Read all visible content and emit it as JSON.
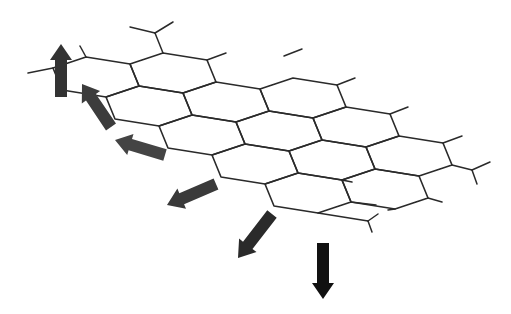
{
  "diagram": {
    "title": "",
    "colors": {
      "background": "#ffffff",
      "bond": "#2a2a2a",
      "arrow_dark": "#111111",
      "arrow_mid": "#3c3c3c",
      "arrow_light": "#4a4a4a"
    },
    "lattice": {
      "origin": [
        163,
        53
      ],
      "edge_vectors": {
        "A": [
          44,
          7
        ],
        "B": [
          9,
          22
        ],
        "C": [
          -33,
          11
        ]
      },
      "translation_i": [
        53,
        29
      ],
      "translation_j": [
        77,
        -4
      ],
      "hexagons": [
        {
          "i": 0,
          "j": -1
        },
        {
          "i": 1,
          "j": -1
        },
        {
          "i": 2,
          "j": -1
        },
        {
          "i": 3,
          "j": -1
        },
        {
          "i": 4,
          "j": -1
        },
        {
          "i": 0,
          "j": 0
        },
        {
          "i": 1,
          "j": 0
        },
        {
          "i": 2,
          "j": 0
        },
        {
          "i": 3,
          "j": 0
        },
        {
          "i": 4,
          "j": 0
        },
        {
          "i": 1,
          "j": 1
        },
        {
          "i": 2,
          "j": 1
        },
        {
          "i": 3,
          "j": 1
        }
      ],
      "dangling_bonds": [
        {
          "from": [
            163,
            53
          ],
          "to": [
            155,
            33
          ],
          "branches": [
            [
              130,
              27
            ],
            [
              173,
              22
            ]
          ]
        },
        {
          "from": [
            207,
            60
          ],
          "to": [
            226,
            53
          ]
        },
        {
          "from": [
            86,
            57
          ],
          "to": [
            80,
            46
          ]
        },
        {
          "from": [
            53,
            68
          ],
          "to": [
            28,
            73
          ]
        },
        {
          "from": [
            284,
            56
          ],
          "to": [
            302,
            49
          ]
        },
        {
          "from": [
            337,
            85
          ],
          "to": [
            355,
            78
          ]
        },
        {
          "from": [
            390,
            114
          ],
          "to": [
            408,
            107
          ]
        },
        {
          "from": [
            443,
            143
          ],
          "to": [
            462,
            136
          ]
        },
        {
          "from": [
            452,
            165
          ],
          "to": [
            472,
            170
          ],
          "branches": [
            [
              490,
              162
            ],
            [
              477,
              184
            ]
          ]
        },
        {
          "from": [
            428,
            198
          ],
          "to": [
            442,
            202
          ]
        },
        {
          "from": [
            395,
            209
          ],
          "to": [
            388,
            210
          ]
        },
        {
          "from": [
            351,
            202
          ],
          "to": [
            376,
            205
          ]
        },
        {
          "from": [
            342,
            180
          ],
          "to": [
            352,
            182
          ]
        },
        {
          "from": [
            318,
            213
          ],
          "to": [
            368,
            221
          ],
          "branches": [
            [
              378,
              214
            ],
            [
              372,
              232
            ]
          ]
        }
      ]
    },
    "arrows": [
      {
        "name": "arrow-up",
        "tail": [
          61,
          97
        ],
        "head": [
          61,
          44
        ],
        "color": "#333333"
      },
      {
        "name": "arrow-up-left",
        "tail": [
          111,
          127
        ],
        "head": [
          82,
          84
        ],
        "color": "#3c3c3c"
      },
      {
        "name": "arrow-left-up",
        "tail": [
          165,
          155
        ],
        "head": [
          115,
          140
        ],
        "color": "#444444"
      },
      {
        "name": "arrow-left-down",
        "tail": [
          216,
          184
        ],
        "head": [
          167,
          205
        ],
        "color": "#3a3a3a"
      },
      {
        "name": "arrow-down-left",
        "tail": [
          272,
          214
        ],
        "head": [
          238,
          258
        ],
        "color": "#2a2a2a"
      },
      {
        "name": "arrow-down",
        "tail": [
          323,
          243
        ],
        "head": [
          323,
          299
        ],
        "color": "#111111"
      }
    ]
  }
}
